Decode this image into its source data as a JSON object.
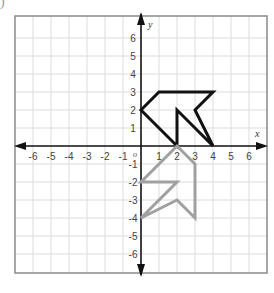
{
  "corner_label": ")",
  "grid": {
    "x_min": -7,
    "x_max": 7,
    "y_min": -7,
    "y_max": 7,
    "unit_px": 18,
    "origin_px": [
      141,
      146
    ],
    "border_color": "#8a8a8a",
    "grid_color": "#dcdcdc",
    "axis_color": "#111111"
  },
  "axes": {
    "x_label": "x",
    "y_label": "y",
    "origin_label": "o",
    "x_ticks": [
      -6,
      -5,
      -4,
      -3,
      -2,
      -1,
      1,
      2,
      3,
      4,
      5,
      6
    ],
    "y_ticks": [
      6,
      5,
      4,
      3,
      2,
      1,
      -1,
      -2,
      -3,
      -4,
      -5,
      -6
    ]
  },
  "figures": [
    {
      "name": "original-figure",
      "color": "#111111",
      "stroke_width": 3,
      "vertices": [
        [
          0,
          2
        ],
        [
          1,
          3
        ],
        [
          4,
          3
        ],
        [
          3,
          2
        ],
        [
          4,
          0
        ],
        [
          2,
          2
        ],
        [
          2,
          0
        ]
      ]
    },
    {
      "name": "rotated-image-figure",
      "color": "#a0a0a0",
      "stroke_width": 3,
      "vertices": [
        [
          2,
          0
        ],
        [
          3,
          -1
        ],
        [
          3,
          -4
        ],
        [
          2,
          -3
        ],
        [
          0,
          -4
        ],
        [
          2,
          -2
        ],
        [
          0,
          -2
        ]
      ]
    }
  ]
}
